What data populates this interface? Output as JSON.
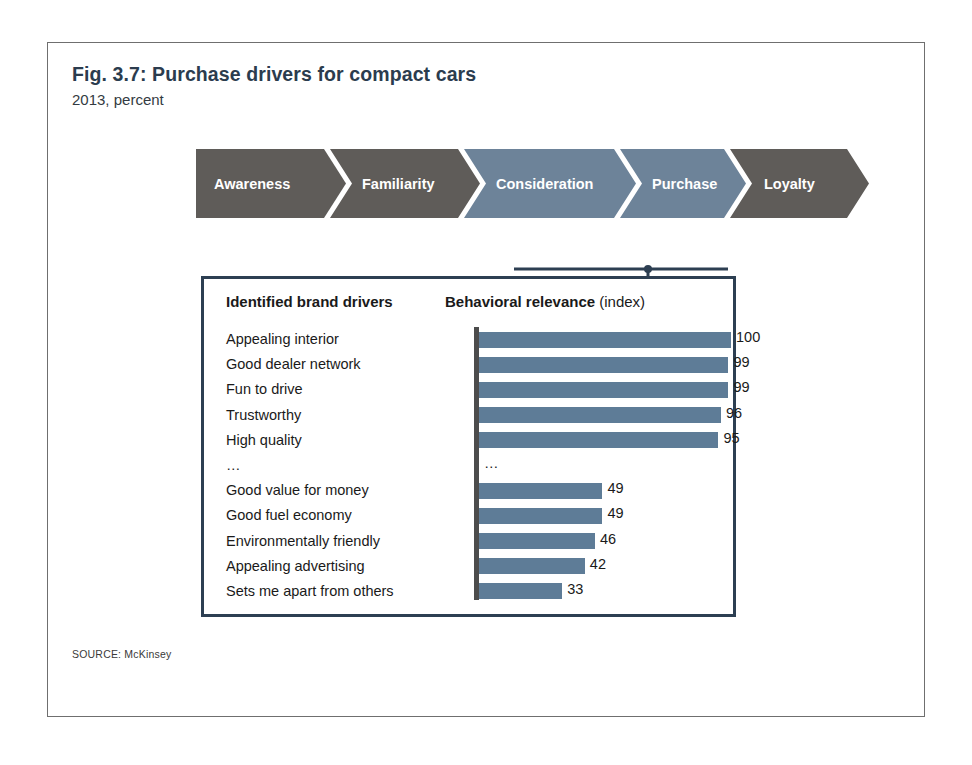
{
  "figure": {
    "title": "Fig. 3.7: Purchase drivers for compact cars",
    "subtitle": "2013, percent",
    "source": "SOURCE: McKinsey"
  },
  "funnel": {
    "stages": [
      {
        "label": "Awareness",
        "state": "inactive",
        "color": "#5f5c59"
      },
      {
        "label": "Familiarity",
        "state": "inactive",
        "color": "#5f5c59"
      },
      {
        "label": "Consideration",
        "state": "highlighted",
        "color": "#6d8399"
      },
      {
        "label": "Purchase",
        "state": "highlighted",
        "color": "#6d8399"
      },
      {
        "label": "Loyalty",
        "state": "inactive",
        "color": "#5f5c59"
      }
    ],
    "highlighted_stages": [
      "Consideration",
      "Purchase"
    ],
    "connector_color": "#2d3f52"
  },
  "detail_box": {
    "column_headers": {
      "drivers": "Identified brand drivers",
      "relevance_bold": "Behavioral relevance",
      "relevance_light": "(index)"
    },
    "border_color": "#2d3f52"
  },
  "chart_data": {
    "type": "bar",
    "orientation": "horizontal",
    "title": "Fig. 3.7: Purchase drivers for compact cars",
    "subtitle": "2013, percent",
    "xlabel": "Behavioral relevance (index)",
    "ylabel": "Identified brand drivers",
    "xlim": [
      0,
      100
    ],
    "grid": false,
    "legend": "none",
    "bar_color": "#5e7c97",
    "categories": [
      "Appealing interior",
      "Good dealer network",
      "Fun to drive",
      "Trustworthy",
      "High quality",
      "…",
      "Good value for money",
      "Good fuel economy",
      "Environmentally friendly",
      "Appealing advertising",
      "Sets me apart from others"
    ],
    "values": [
      100,
      99,
      99,
      96,
      95,
      null,
      49,
      49,
      46,
      42,
      33
    ],
    "value_labels": [
      "100",
      "99",
      "99",
      "96",
      "95",
      "…",
      "49",
      "49",
      "46",
      "42",
      "33"
    ],
    "rows": [
      {
        "label": "Appealing interior",
        "value": 100,
        "value_label": "100",
        "is_break": false
      },
      {
        "label": "Good dealer network",
        "value": 99,
        "value_label": "99",
        "is_break": false
      },
      {
        "label": "Fun to drive",
        "value": 99,
        "value_label": "99",
        "is_break": false
      },
      {
        "label": "Trustworthy",
        "value": 96,
        "value_label": "96",
        "is_break": false
      },
      {
        "label": "High quality",
        "value": 95,
        "value_label": "95",
        "is_break": false
      },
      {
        "label": "…",
        "value": null,
        "value_label": "…",
        "is_break": true
      },
      {
        "label": "Good value for money",
        "value": 49,
        "value_label": "49",
        "is_break": false
      },
      {
        "label": "Good fuel economy",
        "value": 49,
        "value_label": "49",
        "is_break": false
      },
      {
        "label": "Environmentally friendly",
        "value": 46,
        "value_label": "46",
        "is_break": false
      },
      {
        "label": "Appealing advertising",
        "value": 42,
        "value_label": "42",
        "is_break": false
      },
      {
        "label": "Sets me apart from others",
        "value": 33,
        "value_label": "33",
        "is_break": false
      }
    ]
  }
}
